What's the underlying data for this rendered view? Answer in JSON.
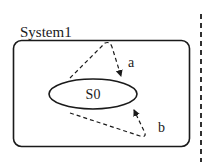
{
  "diagram": {
    "system": {
      "label": "System1"
    },
    "state": {
      "label": "S0"
    },
    "transitions": [
      {
        "label": "a",
        "style": "dashed",
        "direction": "self-loop top"
      },
      {
        "label": "b",
        "style": "dashed",
        "direction": "self-loop bottom"
      }
    ],
    "boundary": {
      "style": "dashed vertical line"
    },
    "colors": {
      "stroke": "#1a1a1a",
      "background": "#ffffff"
    }
  }
}
